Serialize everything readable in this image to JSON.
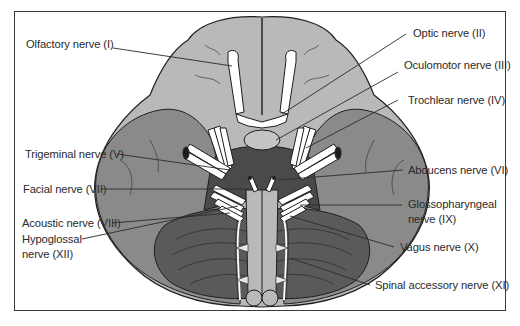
{
  "figure": {
    "type": "anatomical-diagram",
    "colors": {
      "frame": "#3a3a3a",
      "cerebrum": "#b9b9b9",
      "temporal_lobe": "#8a8a8a",
      "brainstem_dark": "#4a4a4a",
      "cerebellum": "#5a5a5a",
      "cerebellum_rim": "#8c8c8c",
      "nerves": "#ffffff",
      "outline": "#1e1e1e",
      "leader_line": "#2a2a2a",
      "label_text": "#2a2a2a"
    }
  },
  "labels": {
    "left": [
      {
        "id": "olfactory",
        "text": "Olfactory nerve (I)"
      },
      {
        "id": "trigeminal",
        "text": "Trigeminal nerve (V)"
      },
      {
        "id": "facial",
        "text": "Facial nerve (VII)"
      },
      {
        "id": "acoustic",
        "text": "Acoustic nerve (VIII)"
      },
      {
        "id": "hypoglossal_line1",
        "text": "Hypoglossal"
      },
      {
        "id": "hypoglossal_line2",
        "text": "nerve (XII)"
      }
    ],
    "right": [
      {
        "id": "optic",
        "text": "Optic nerve (II)"
      },
      {
        "id": "oculomotor",
        "text": "Oculomotor nerve (III)"
      },
      {
        "id": "trochlear",
        "text": "Trochlear nerve (IV)"
      },
      {
        "id": "abducens",
        "text": "Abducens nerve (VI)"
      },
      {
        "id": "glossopharyngeal_line1",
        "text": "Glossopharyngeal"
      },
      {
        "id": "glossopharyngeal_line2",
        "text": "nerve (IX)"
      },
      {
        "id": "vagus",
        "text": "Vagus nerve (X)"
      },
      {
        "id": "spinal_accessory",
        "text": "Spinal accessory nerve (XI)"
      }
    ]
  }
}
